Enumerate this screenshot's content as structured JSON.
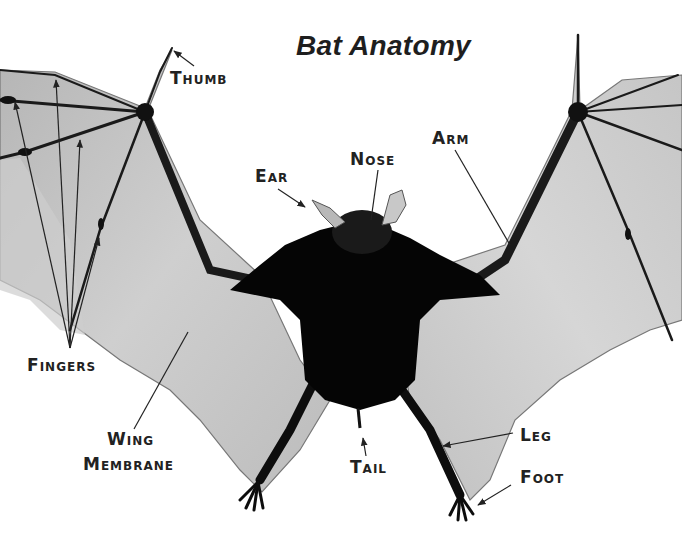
{
  "title": "Bat Anatomy",
  "labels": {
    "thumb": {
      "first": "T",
      "rest": "HUMB"
    },
    "ear": {
      "first": "E",
      "rest": "AR"
    },
    "nose": {
      "first": "N",
      "rest": "OSE"
    },
    "arm": {
      "first": "A",
      "rest": "RM"
    },
    "fingers": {
      "first": "F",
      "rest": "INGERS"
    },
    "wing": {
      "first": "W",
      "rest": "ING"
    },
    "membrane": {
      "first": "M",
      "rest": "EMBRANE"
    },
    "tail": {
      "first": "T",
      "rest": "AIL"
    },
    "leg": {
      "first": "L",
      "rest": "EG"
    },
    "foot": {
      "first": "F",
      "rest": "OOT"
    }
  },
  "colors": {
    "background": "#ffffff",
    "membrane": "#bdbdbd",
    "bone": "#1a1a1a",
    "body": "#050505",
    "text": "#222222"
  }
}
